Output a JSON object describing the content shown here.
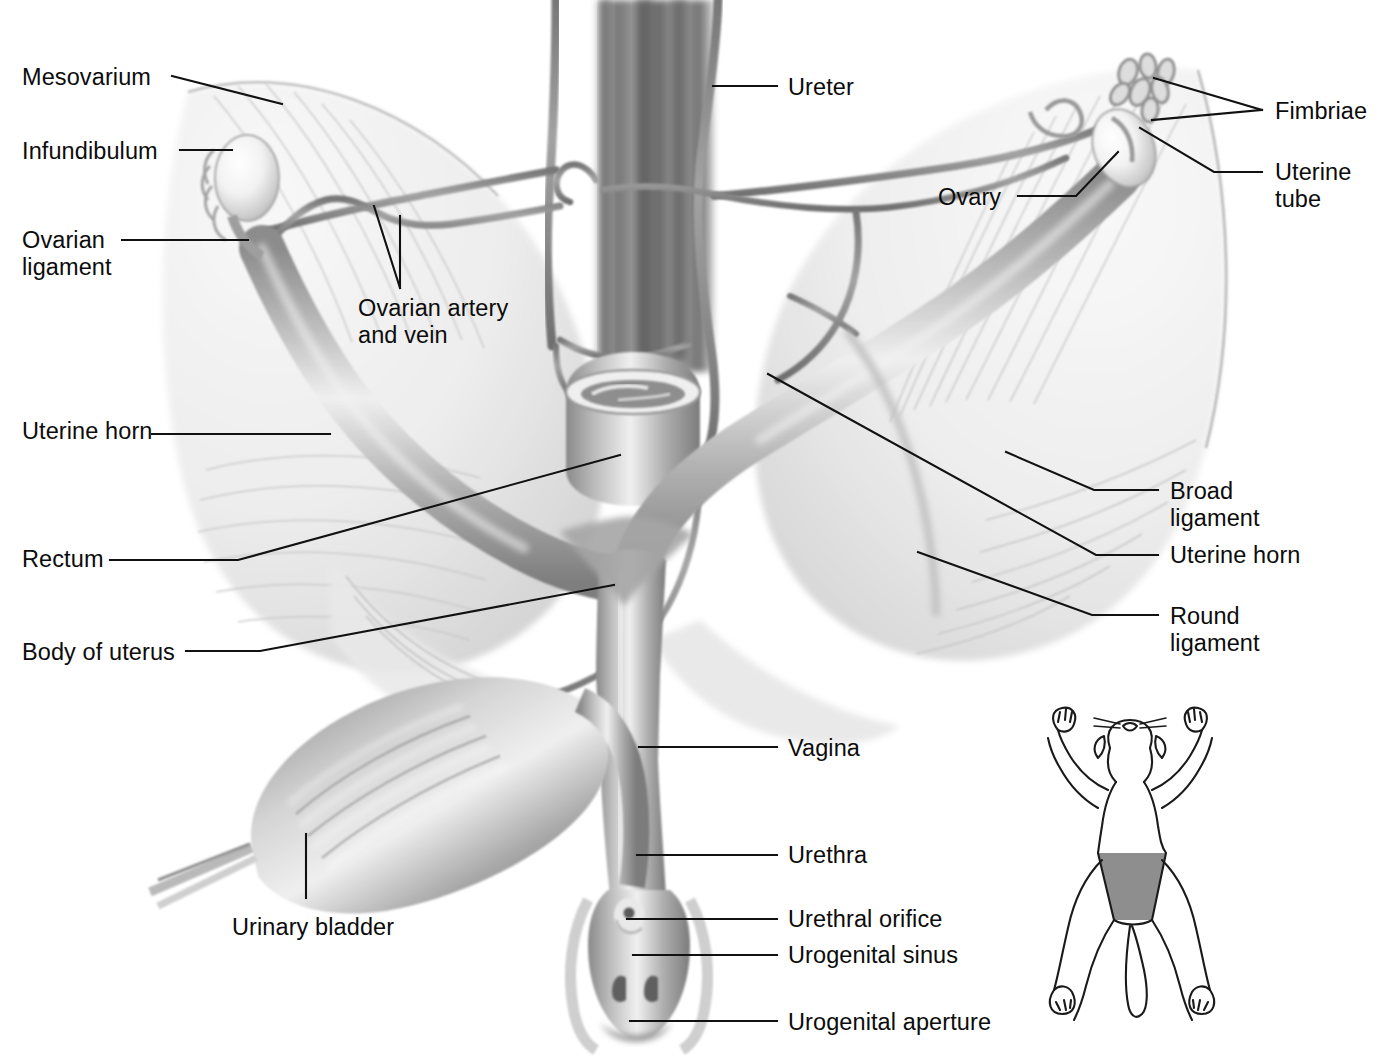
{
  "figure": {
    "view": "ventral dissection",
    "background_color": "#ffffff",
    "ink_color": "#111111",
    "canvas": {
      "width": 1379,
      "height": 1060
    }
  },
  "labels": [
    {
      "id": "mesovarium",
      "text": "Mesovarium",
      "side": "left",
      "x": 22,
      "y": 64
    },
    {
      "id": "infundibulum",
      "text": "Infundibulum",
      "side": "left",
      "x": 22,
      "y": 138
    },
    {
      "id": "ovarian-ligament",
      "text": "Ovarian\nligament",
      "side": "left",
      "x": 22,
      "y": 227
    },
    {
      "id": "ovarian-artery-vein",
      "text": "Ovarian artery\nand vein",
      "side": "left",
      "x": 358,
      "y": 295
    },
    {
      "id": "uterine-horn-left",
      "text": "Uterine horn",
      "side": "left",
      "x": 22,
      "y": 418
    },
    {
      "id": "rectum",
      "text": "Rectum",
      "side": "left",
      "x": 22,
      "y": 546
    },
    {
      "id": "body-of-uterus",
      "text": "Body of uterus",
      "side": "left",
      "x": 22,
      "y": 639
    },
    {
      "id": "urinary-bladder",
      "text": "Urinary bladder",
      "side": "left",
      "x": 232,
      "y": 914
    },
    {
      "id": "ureter",
      "text": "Ureter",
      "side": "right",
      "x": 788,
      "y": 74
    },
    {
      "id": "ovary",
      "text": "Ovary",
      "side": "right",
      "x": 938,
      "y": 184
    },
    {
      "id": "fimbriae",
      "text": "Fimbriae",
      "side": "right",
      "x": 1275,
      "y": 98
    },
    {
      "id": "uterine-tube",
      "text": "Uterine\ntube",
      "side": "right",
      "x": 1275,
      "y": 159
    },
    {
      "id": "broad-ligament",
      "text": "Broad\nligament",
      "side": "right",
      "x": 1170,
      "y": 478
    },
    {
      "id": "uterine-horn-right",
      "text": "Uterine horn",
      "side": "right",
      "x": 1170,
      "y": 542
    },
    {
      "id": "round-ligament",
      "text": "Round\nligament",
      "side": "right",
      "x": 1170,
      "y": 603
    },
    {
      "id": "vagina",
      "text": "Vagina",
      "side": "right",
      "x": 788,
      "y": 735
    },
    {
      "id": "urethra",
      "text": "Urethra",
      "side": "right",
      "x": 788,
      "y": 842
    },
    {
      "id": "urethral-orifice",
      "text": "Urethral orifice",
      "side": "right",
      "x": 788,
      "y": 906
    },
    {
      "id": "urogenital-sinus",
      "text": "Urogenital sinus",
      "side": "right",
      "x": 788,
      "y": 942
    },
    {
      "id": "urogenital-aperture",
      "text": "Urogenital aperture",
      "side": "right",
      "x": 788,
      "y": 1009
    }
  ],
  "leaders": [
    {
      "id": "lead-mesovarium",
      "points": [
        [
          172,
          76
        ],
        [
          282,
          104
        ]
      ]
    },
    {
      "id": "lead-infundibulum",
      "points": [
        [
          180,
          150
        ],
        [
          232,
          150
        ]
      ]
    },
    {
      "id": "lead-ovarian-ligament",
      "points": [
        [
          122,
          240
        ],
        [
          248,
          240
        ]
      ]
    },
    {
      "id": "lead-ovarian-artery-a",
      "points": [
        [
          400,
          288
        ],
        [
          374,
          206
        ]
      ]
    },
    {
      "id": "lead-ovarian-artery-b",
      "points": [
        [
          400,
          288
        ],
        [
          400,
          216
        ]
      ]
    },
    {
      "id": "lead-uterine-horn-left",
      "points": [
        [
          152,
          434
        ],
        [
          330,
          434
        ]
      ]
    },
    {
      "id": "lead-rectum",
      "points": [
        [
          110,
          560
        ],
        [
          238,
          560
        ],
        [
          620,
          455
        ]
      ]
    },
    {
      "id": "lead-body-of-uterus",
      "points": [
        [
          186,
          651
        ],
        [
          260,
          651
        ],
        [
          614,
          585
        ]
      ]
    },
    {
      "id": "lead-urinary-bladder",
      "points": [
        [
          306,
          898
        ],
        [
          306,
          834
        ]
      ]
    },
    {
      "id": "lead-ureter",
      "points": [
        [
          713,
          86
        ],
        [
          777,
          86
        ]
      ]
    },
    {
      "id": "lead-ovary",
      "points": [
        [
          1018,
          196
        ],
        [
          1076,
          196
        ],
        [
          1118,
          152
        ]
      ]
    },
    {
      "id": "lead-fimbriae-a",
      "points": [
        [
          1262,
          110
        ],
        [
          1154,
          78
        ]
      ]
    },
    {
      "id": "lead-fimbriae-b",
      "points": [
        [
          1262,
          110
        ],
        [
          1152,
          120
        ]
      ]
    },
    {
      "id": "lead-uterine-tube",
      "points": [
        [
          1262,
          172
        ],
        [
          1214,
          172
        ],
        [
          1140,
          128
        ]
      ]
    },
    {
      "id": "lead-broad-ligament",
      "points": [
        [
          1158,
          490
        ],
        [
          1094,
          490
        ],
        [
          1006,
          452
        ]
      ]
    },
    {
      "id": "lead-uterine-horn-right",
      "points": [
        [
          1158,
          555
        ],
        [
          1096,
          555
        ],
        [
          768,
          374
        ]
      ]
    },
    {
      "id": "lead-round-ligament",
      "points": [
        [
          1158,
          615
        ],
        [
          1092,
          615
        ],
        [
          918,
          552
        ]
      ]
    },
    {
      "id": "lead-vagina",
      "points": [
        [
          777,
          747
        ],
        [
          639,
          747
        ]
      ]
    },
    {
      "id": "lead-urethra",
      "points": [
        [
          777,
          855
        ],
        [
          637,
          855
        ]
      ]
    },
    {
      "id": "lead-urethral-orifice",
      "points": [
        [
          777,
          919
        ],
        [
          627,
          919
        ]
      ]
    },
    {
      "id": "lead-urogenital-sinus",
      "points": [
        [
          777,
          955
        ],
        [
          633,
          955
        ]
      ]
    },
    {
      "id": "lead-urogenital-aperture",
      "points": [
        [
          777,
          1021
        ],
        [
          630,
          1021
        ]
      ]
    }
  ],
  "inset": {
    "name": "cat-orientation-inset",
    "description": "Ventral view outline of a cat with the shaded region marking the abdominal area dissected",
    "shaded_region_color": "#8e8e8e",
    "outline_color": "#1a1a1a",
    "x": 980,
    "y": 690,
    "width": 280,
    "height": 340
  }
}
